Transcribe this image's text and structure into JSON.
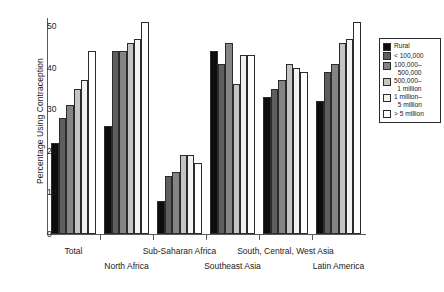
{
  "chart_data": {
    "type": "bar",
    "title": "",
    "subtitle": "",
    "xlabel": "",
    "ylabel": "Percentage Using Contraception",
    "ylim": [
      0,
      52
    ],
    "yticks": [
      0,
      10,
      20,
      30,
      40,
      50
    ],
    "grid": false,
    "legend_position": "right",
    "categories": [
      "Total",
      "North Africa",
      "Sub-Saharan Africa",
      "Southeast Asia",
      "South, Central, West Asia",
      "Latin America"
    ],
    "series": [
      {
        "name": "Rural",
        "color": "#0d0d0d",
        "values": [
          22,
          26,
          8,
          44,
          33,
          32
        ]
      },
      {
        "name": "< 100,000",
        "color": "#5e5e5e",
        "values": [
          28,
          44,
          14,
          41,
          35,
          39
        ]
      },
      {
        "name": "100,000-500,000",
        "color": "#848484",
        "values": [
          31,
          44,
          15,
          46,
          37,
          41
        ]
      },
      {
        "name": "500,000-1 million",
        "color": "#c4c4c4",
        "values": [
          35,
          46,
          19,
          36,
          41,
          46
        ]
      },
      {
        "name": "1 million-5 million",
        "color": "#f2f2f2",
        "values": [
          37,
          47,
          19,
          43,
          40,
          47
        ]
      },
      {
        "name": "> 5 million",
        "color": "#ffffff",
        "values": [
          44,
          51,
          17,
          43,
          39,
          51
        ]
      }
    ]
  },
  "axis": {
    "y_title": "Percentage Using Contraception",
    "y_tick_labels": [
      "0",
      "10",
      "20",
      "30",
      "40",
      "50"
    ],
    "x_tick_labels": [
      "Total",
      "North Africa",
      "Sub-Saharan Africa",
      "Southeast Asia",
      "South, Central, West Asia",
      "Latin America"
    ]
  },
  "legend": {
    "items": [
      {
        "label": "Rural",
        "line1": "Rural",
        "line2": "",
        "color": "#0d0d0d"
      },
      {
        "label": "< 100,000",
        "line1": "< 100,000",
        "line2": "",
        "color": "#5e5e5e"
      },
      {
        "label": "100,000-500,000",
        "line1": "100,000–",
        "line2": "500,000",
        "color": "#848484"
      },
      {
        "label": "500,000-1 million",
        "line1": "500,000–",
        "line2": "1 million",
        "color": "#c4c4c4"
      },
      {
        "label": "1 million-5 million",
        "line1": "1 million–",
        "line2": "5 million",
        "color": "#f2f2f2"
      },
      {
        "label": "> 5 million",
        "line1": "> 5 million",
        "line2": "",
        "color": "#ffffff"
      }
    ]
  },
  "colors": {
    "axis": "#5a5a5a",
    "bar_outline": "#2b2b2b",
    "background": "#ffffff",
    "text": "#1a1a1a"
  }
}
